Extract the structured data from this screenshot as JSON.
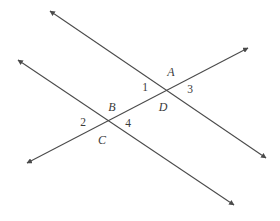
{
  "figure": {
    "kind": "geometry-diagram",
    "width": 280,
    "height": 221,
    "background_color": "#ffffff",
    "line_color": "#4a4a4a",
    "label_color": "#3a3a3a",
    "lines": [
      {
        "name": "line-through-A-upper",
        "x1": 50,
        "y1": 11,
        "x2": 266,
        "y2": 158,
        "arrow_start": true,
        "arrow_end": true
      },
      {
        "name": "line-through-BC-lower",
        "x1": 18,
        "y1": 60,
        "x2": 234,
        "y2": 205,
        "arrow_start": true,
        "arrow_end": true
      },
      {
        "name": "line-transversal-rising",
        "x1": 27,
        "y1": 163,
        "x2": 248,
        "y2": 48,
        "arrow_start": true,
        "arrow_end": true
      }
    ],
    "point_labels": [
      {
        "name": "label-A",
        "text": "A",
        "x": 171,
        "y": 72
      },
      {
        "name": "label-B",
        "text": "B",
        "x": 112,
        "y": 107
      },
      {
        "name": "label-C",
        "text": "C",
        "x": 102,
        "y": 140
      },
      {
        "name": "label-D",
        "text": "D",
        "x": 163,
        "y": 107
      }
    ],
    "angle_labels": [
      {
        "name": "label-angle-1",
        "text": "1",
        "x": 145,
        "y": 88
      },
      {
        "name": "label-angle-2",
        "text": "2",
        "x": 83,
        "y": 123
      },
      {
        "name": "label-angle-3",
        "text": "3",
        "x": 190,
        "y": 90
      },
      {
        "name": "label-angle-4",
        "text": "4",
        "x": 128,
        "y": 124
      }
    ]
  }
}
